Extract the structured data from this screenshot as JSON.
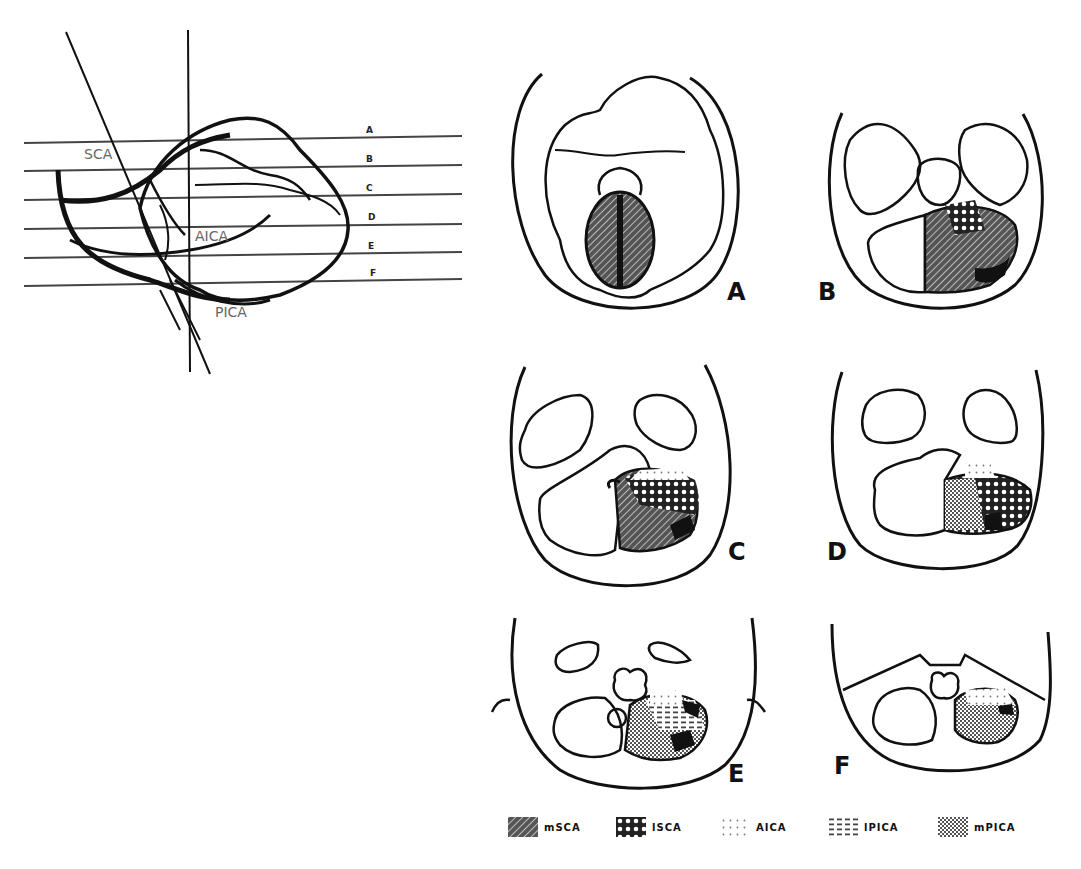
{
  "figure": {
    "sagittal_view": {
      "line_labels": [
        "A",
        "B",
        "C",
        "D",
        "E",
        "F"
      ],
      "artery_labels": {
        "sca": "SCA",
        "aica": "AICA",
        "pica": "PICA"
      }
    },
    "axial_panels": [
      {
        "id": "A",
        "label": "A"
      },
      {
        "id": "B",
        "label": "B"
      },
      {
        "id": "C",
        "label": "C"
      },
      {
        "id": "D",
        "label": "D"
      },
      {
        "id": "E",
        "label": "E"
      },
      {
        "id": "F",
        "label": "F"
      }
    ],
    "legend": [
      {
        "pattern": "diagonal-hatch",
        "label": "mSCA"
      },
      {
        "pattern": "crosshatch-diamond",
        "label": "lSCA"
      },
      {
        "pattern": "sparse-dots",
        "label": "AICA"
      },
      {
        "pattern": "dashes",
        "label": "lPICA"
      },
      {
        "pattern": "checker",
        "label": "mPICA"
      }
    ],
    "colors": {
      "ink": "#111111",
      "background": "#ffffff",
      "label_gray": "#666666"
    }
  }
}
